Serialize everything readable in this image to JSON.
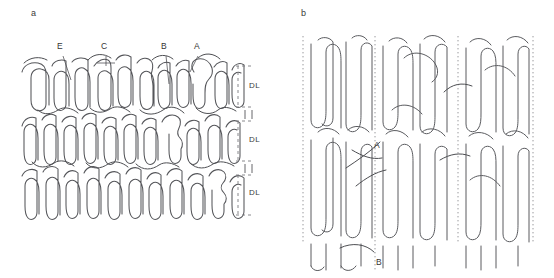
{
  "figure": {
    "background_color": "#ffffff",
    "chain_color": "#55565a",
    "guide_color": "#8d8d91",
    "width": 554,
    "height": 278
  },
  "panels": [
    {
      "id": "a",
      "label": "a",
      "label_x": 33,
      "label_y": 9,
      "description": "Horizontal stacked lamellae drawn as tight serpentine chain folds in four bands",
      "callouts": [
        {
          "label": "E",
          "x": 59,
          "y": 45,
          "leader_x1": 63,
          "leader_y1": 56,
          "leader_x2": 71,
          "leader_y2": 80
        },
        {
          "label": "C",
          "x": 103,
          "y": 45,
          "leader_x1": 106,
          "leader_y1": 56,
          "leader_x2": 106,
          "leader_y2": 66
        },
        {
          "label": "B",
          "x": 163,
          "y": 45,
          "leader_x1": 166,
          "leader_y1": 56,
          "leader_x2": 169,
          "leader_y2": 84
        },
        {
          "label": "A",
          "x": 196,
          "y": 45,
          "leader_x1": 198,
          "leader_y1": 56,
          "leader_x2": 190,
          "leader_y2": 72
        }
      ],
      "brackets": [
        {
          "label": "DL",
          "label_x": 248,
          "label_y": 86,
          "top": 66,
          "bottom": 107
        },
        {
          "label": "DL",
          "label_x": 248,
          "label_y": 140,
          "top": 121,
          "bottom": 161
        },
        {
          "label": "DL",
          "label_x": 248,
          "label_y": 192,
          "top": 175,
          "bottom": 215
        }
      ],
      "interlayer_marks": [
        {
          "x": 245,
          "y_top": 110,
          "y_bottom": 119
        },
        {
          "x": 252,
          "y_top": 110,
          "y_bottom": 119
        },
        {
          "x": 245,
          "y_top": 164,
          "y_bottom": 173
        },
        {
          "x": 252,
          "y_top": 164,
          "y_bottom": 173
        }
      ]
    },
    {
      "id": "b",
      "label": "b",
      "label_x": 303,
      "label_y": 9,
      "description": "Vertical serpentine chain folds divided by dotted lamellar boundary lines",
      "boundaries": [
        {
          "x": 303,
          "y_top": 36,
          "y_bottom": 242
        },
        {
          "x": 375,
          "y_top": 36,
          "y_bottom": 272
        },
        {
          "x": 458,
          "y_top": 36,
          "y_bottom": 242
        },
        {
          "x": 533,
          "y_top": 36,
          "y_bottom": 242
        }
      ],
      "callouts": [
        {
          "label": "A",
          "x": 376,
          "y": 145
        },
        {
          "label": "B",
          "x": 378,
          "y": 262
        }
      ]
    }
  ],
  "annotation_glossary": {
    "DL": "DL",
    "A": "A",
    "B": "B",
    "C": "C",
    "E": "E"
  }
}
